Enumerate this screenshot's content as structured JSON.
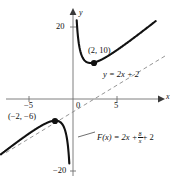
{
  "chart_data": {
    "type": "line",
    "title": "",
    "xlabel": "x",
    "ylabel": "y",
    "xlim": [
      -8.3,
      9.8
    ],
    "ylim": [
      -22,
      22
    ],
    "grid": false,
    "legend": "none",
    "axis_ticks": {
      "x": [
        "-5",
        "0",
        "5"
      ],
      "x_values": [
        -5,
        0,
        5
      ],
      "y": [
        "20",
        "-20"
      ],
      "y_values": [
        20,
        -20
      ]
    },
    "series": [
      {
        "name": "F(x) = 2x + 8/x + 2",
        "style": "solid",
        "formula_text": "F(x) = 2x +",
        "formula_num": "8",
        "formula_den": "x",
        "formula_tail": "+ 2",
        "vertical_asymptote": 0,
        "branches": [
          {
            "name": "left-branch",
            "x_from": -8.2,
            "x_to": -0.42
          },
          {
            "name": "right-branch",
            "x_from": 0.42,
            "x_to": 9.4
          }
        ]
      },
      {
        "name": "y = 2x + 2",
        "style": "dashed",
        "label": "y = 2x + 2",
        "slope": 2,
        "intercept": 2
      }
    ],
    "points": [
      {
        "label": "(2, 10)",
        "x": 2,
        "y": 10,
        "marker": "filled-circle",
        "kind": "local-minimum"
      },
      {
        "label": "(-2, -6)",
        "x": -2,
        "y": -6,
        "marker": "filled-circle",
        "kind": "local-maximum"
      }
    ],
    "annotations": [
      {
        "name": "point-label-max",
        "text": "(2, 10)"
      },
      {
        "name": "point-label-min",
        "text": "(−2, −6)"
      },
      {
        "name": "asymptote-label",
        "text": "y = 2x + 2"
      },
      {
        "name": "axis-label-x",
        "text": "x"
      },
      {
        "name": "axis-label-y",
        "text": "y"
      },
      {
        "name": "tick-label-y-top",
        "text": "20"
      },
      {
        "name": "tick-label-y-bottom",
        "text": "−20"
      },
      {
        "name": "tick-label-x-neg",
        "text": "−5"
      },
      {
        "name": "tick-label-x-zero",
        "text": "0"
      },
      {
        "name": "tick-label-x-pos",
        "text": "5"
      }
    ],
    "colors": {
      "curve": "#111111",
      "axis": "#6f6f6f",
      "asymptote": "#8a8a8a",
      "text": "#111111"
    }
  }
}
